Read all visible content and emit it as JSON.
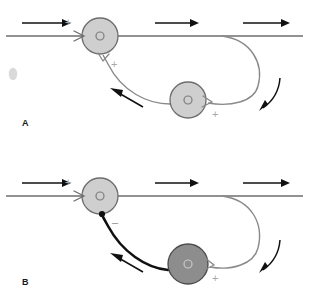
{
  "figure": {
    "width": 309,
    "height": 303,
    "background_color": "#ffffff",
    "type": "neural-circuit-diagram",
    "panels": [
      {
        "id": "A",
        "label": "A",
        "label_position": {
          "x": 22,
          "y": 126
        },
        "description": "Excitatory feedback loop: light (excitatory) interneuron receives collateral and returns a plus sign synapse",
        "main_axon": {
          "name": "horizontal-axon",
          "stroke_color": "#6e6e6e",
          "y": 36,
          "x_start": 6,
          "x_end": 303
        },
        "somas": [
          {
            "name": "soma-upper",
            "shade": "light",
            "fill": "#cfcfcf",
            "stroke": "#6d6d6d",
            "cx": 100,
            "cy": 36,
            "r": 18,
            "nucleus_r": 4
          },
          {
            "name": "soma-lower",
            "shade": "light",
            "fill": "#cfcfcf",
            "stroke": "#6d6d6d",
            "cx": 188,
            "cy": 100,
            "r": 18,
            "nucleus_r": 4
          }
        ],
        "signs": [
          {
            "name": "sign-plus-input",
            "symbol": "+",
            "x": 65,
            "y": 24,
            "color": "#a8a8a8"
          },
          {
            "name": "sign-plus-upper-output",
            "symbol": "+",
            "x": 111,
            "y": 66,
            "color": "#a8a8a8"
          },
          {
            "name": "sign-plus-lower-output",
            "symbol": "+",
            "x": 212,
            "y": 116,
            "color": "#a8a8a8"
          }
        ],
        "flow_arrows": [
          {
            "name": "flow-arrow-left",
            "direction": "right",
            "x1": 22,
            "y1": 23,
            "x2": 68,
            "y2": 23
          },
          {
            "name": "flow-arrow-mid",
            "direction": "right",
            "x1": 155,
            "y1": 23,
            "x2": 196,
            "y2": 23
          },
          {
            "name": "flow-arrow-right",
            "direction": "right",
            "x1": 243,
            "y1": 23,
            "x2": 288,
            "y2": 23
          },
          {
            "name": "flow-arrow-descending",
            "direction": "down-left-curve"
          },
          {
            "name": "flow-arrow-returning",
            "direction": "left-curve"
          }
        ],
        "collateral_color": "#8a8a8a",
        "feedback_color": "#8a8a8a"
      },
      {
        "id": "B",
        "label": "B",
        "label_position": {
          "x": 22,
          "y": 285
        },
        "description": "Inhibitory feedback loop: dark (inhibitory) interneuron returns a minus sign synapse via a thick black axon",
        "main_axon": {
          "name": "horizontal-axon",
          "stroke_color": "#6e6e6e",
          "y": 196,
          "x_start": 6,
          "x_end": 303
        },
        "somas": [
          {
            "name": "soma-upper",
            "shade": "light",
            "fill": "#cfcfcf",
            "stroke": "#6d6d6d",
            "cx": 100,
            "cy": 196,
            "r": 18,
            "nucleus_r": 4
          },
          {
            "name": "soma-lower",
            "shade": "dark",
            "fill": "#8d8d8d",
            "stroke": "#4a4a4a",
            "cx": 188,
            "cy": 264,
            "r": 20,
            "nucleus_r": 4
          }
        ],
        "signs": [
          {
            "name": "sign-plus-input",
            "symbol": "+",
            "x": 65,
            "y": 184,
            "color": "#a8a8a8"
          },
          {
            "name": "sign-minus-upper-input",
            "symbol": "–",
            "x": 113,
            "y": 224,
            "color": "#8e8e8e"
          },
          {
            "name": "sign-plus-lower-output",
            "symbol": "+",
            "x": 212,
            "y": 280,
            "color": "#a8a8a8"
          }
        ],
        "flow_arrows": [
          {
            "name": "flow-arrow-left",
            "direction": "right",
            "x1": 22,
            "y1": 183,
            "x2": 68,
            "y2": 183
          },
          {
            "name": "flow-arrow-mid",
            "direction": "right",
            "x1": 155,
            "y1": 183,
            "x2": 196,
            "y2": 183
          },
          {
            "name": "flow-arrow-right",
            "direction": "right",
            "x1": 243,
            "y1": 183,
            "x2": 288,
            "y2": 183
          },
          {
            "name": "flow-arrow-descending",
            "direction": "down-left-curve"
          },
          {
            "name": "flow-arrow-returning",
            "direction": "left-curve"
          }
        ],
        "collateral_color": "#8a8a8a",
        "feedback_color": "#111111"
      }
    ],
    "artifact": {
      "name": "scan-smudge",
      "cx": 13,
      "cy": 74,
      "rx": 4,
      "ry": 6,
      "color": "#b9b9b9"
    }
  }
}
